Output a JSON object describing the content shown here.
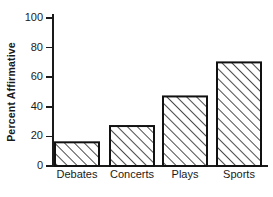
{
  "chart_data": {
    "type": "bar",
    "title": "",
    "xlabel": "",
    "ylabel": "Percent Affirmative",
    "categories": [
      "Debates",
      "Concerts",
      "Plays",
      "Sports"
    ],
    "values": [
      16,
      27,
      47,
      70
    ],
    "ylim": [
      0,
      100
    ],
    "yticks": [
      0,
      20,
      40,
      60,
      80,
      100
    ],
    "ytick_labels": [
      "0",
      "20",
      "40",
      "60",
      "80",
      "100"
    ],
    "grid": false,
    "legend": null,
    "bar_fill": "diagonal-hatch",
    "bar_edge_color": "#111111",
    "background_color": "#ffffff",
    "axis_color": "#1a1a1a"
  },
  "axis": {
    "y_title": "Percent Affirmative"
  },
  "ticks": {
    "t0": "0",
    "t1": "20",
    "t2": "40",
    "t3": "60",
    "t4": "80",
    "t5": "100"
  },
  "categories": {
    "c0": "Debates",
    "c1": "Concerts",
    "c2": "Plays",
    "c3": "Sports"
  }
}
